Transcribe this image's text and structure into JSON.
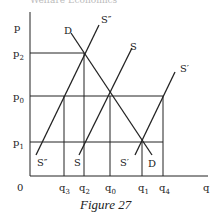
{
  "top_text": "Welfare Economics",
  "figure": {
    "caption": "Figure 27",
    "axes": {
      "y_label": "p",
      "x_label": "q",
      "origin_label": "0"
    },
    "price_levels": [
      {
        "label": "p",
        "sub": "2",
        "y": 53
      },
      {
        "label": "p",
        "sub": "0",
        "y": 96
      },
      {
        "label": "p",
        "sub": "1",
        "y": 142
      }
    ],
    "quantity_levels": [
      {
        "label": "q",
        "sub": "3",
        "x": 64
      },
      {
        "label": "q",
        "sub": "2",
        "x": 84
      },
      {
        "label": "q",
        "sub": "0",
        "x": 110
      },
      {
        "label": "q",
        "sub": "1",
        "x": 142
      },
      {
        "label": "q",
        "sub": "4",
        "x": 163
      }
    ],
    "curves": [
      {
        "name": "D",
        "top_label": "D",
        "bottom_label": "D"
      },
      {
        "name": "S",
        "top_label": "S",
        "bottom_label": "S"
      },
      {
        "name": "S''",
        "top_label": "S″",
        "bottom_label": "S″"
      },
      {
        "name": "S'",
        "top_label": "S′",
        "bottom_label": "S′"
      }
    ]
  }
}
